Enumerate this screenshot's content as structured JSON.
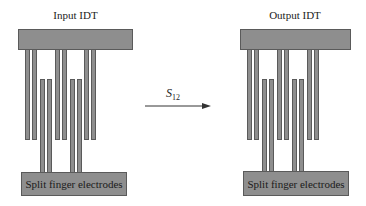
{
  "left_idt": {
    "title": "Input IDT",
    "bottom_label": "Split finger electrodes"
  },
  "right_idt": {
    "title": "Output IDT",
    "bottom_label": "Split finger electrodes"
  },
  "arrow": {
    "label_main": "S",
    "label_sub": "12"
  },
  "colors": {
    "electrode_fill": "#8e8e8e",
    "electrode_border": "#5a5a5a"
  }
}
